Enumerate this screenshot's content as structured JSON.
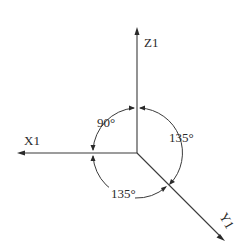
{
  "diagram": {
    "type": "isometric-axes",
    "axes": {
      "z": {
        "label": "Z1",
        "direction": "up"
      },
      "x": {
        "label": "X1",
        "direction": "left"
      },
      "y": {
        "label": "Y1",
        "direction": "down-right"
      }
    },
    "angles": {
      "x_z": "90°",
      "z_y": "135°",
      "y_x": "135°"
    },
    "colors": {
      "line": "#3a3a3a",
      "text": "#2a2a2a",
      "background": "#ffffff"
    }
  }
}
